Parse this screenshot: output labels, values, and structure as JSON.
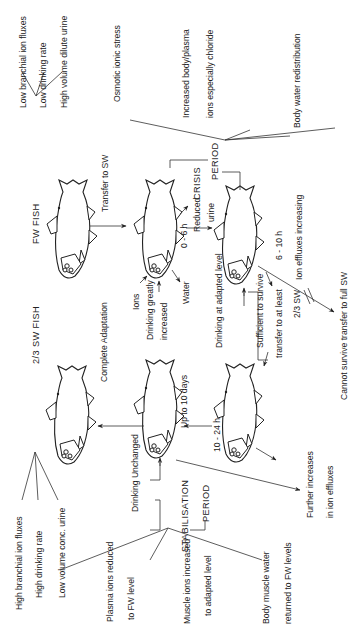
{
  "diagram": {
    "orientation": "rotated 90deg counter-clockwise (text reads bottom-to-top)",
    "stages": {
      "fw_fish": {
        "label": "FW FISH",
        "traits": [
          "Low branchial ion fluxes",
          "Low drinking rate",
          "High volume dilute urine"
        ]
      },
      "sw_fish": {
        "label": "2/3  SW FISH",
        "traits": [
          "High branchial ion fluxes",
          "High drinking rate",
          "Low volume conc. urine"
        ]
      }
    },
    "transitions": {
      "transfer": "Transfer to SW",
      "complete": "Complete Adaptation",
      "up_to_10_days": "Up to 10 days"
    },
    "crisis": {
      "title_line1": "CRISIS",
      "title_line2": "PERIOD",
      "effects": [
        "Osmotic  ionic stress",
        "Increased body/plasma",
        "ions especially chloride",
        "Body water redistribution"
      ],
      "fish1_labels": {
        "ions": "Ions",
        "drinking_1": "Drinking greatly",
        "drinking_2": "increased",
        "water": "Water",
        "time": "0 - 6 h",
        "reduced_1": "Reduced",
        "reduced_2": "urine"
      },
      "fish2_labels": {
        "drinking": "Drinking at adapted level",
        "time": "6 - 10 h",
        "ion_effluxes": "Ion effluxes increasing",
        "cannot": "Cannot survive transfer to full SW"
      }
    },
    "survival": {
      "line1": "Sufficient to survive",
      "line2": "transfer to at least",
      "line3": "2/3 SW",
      "time": "10 - 24 h"
    },
    "stabilisation": {
      "title_line1": "STABILISATION",
      "title_line2": "PERIOD",
      "drinking": "Drinking Unchanged",
      "further_1": "Further increases",
      "further_2": "in ion effluxes",
      "effects": [
        {
          "l1": "Plasma ions reduced",
          "l2": "to  FW level"
        },
        {
          "l1": "Muscle ions increased",
          "l2": "to adapted level"
        },
        {
          "l1": "Body muscle water",
          "l2": "returned to FW levels"
        }
      ]
    }
  }
}
